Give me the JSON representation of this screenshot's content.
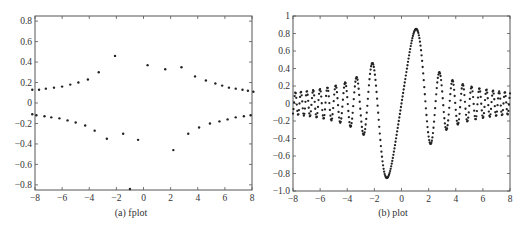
{
  "chart_data": [
    {
      "type": "scatter",
      "title": "",
      "caption": "(a) fplot",
      "function": "sin(x^2)/x",
      "xlabel": "",
      "ylabel": "",
      "xlim": [
        -8,
        8
      ],
      "ylim": [
        -0.85,
        0.85
      ],
      "xticks": [
        -8,
        -6,
        -4,
        -2,
        0,
        2,
        4,
        6,
        8
      ],
      "yticks": [
        -0.8,
        -0.6,
        -0.4,
        -0.2,
        0,
        0.2,
        0.4,
        0.6,
        0.8
      ],
      "xtick_labels": [
        "−8",
        "−6",
        "−4",
        "−2",
        "0",
        "2",
        "4",
        "6",
        "8"
      ],
      "ytick_labels": [
        "−0.8",
        "−0.6",
        "−0.4",
        "−0.2",
        "0",
        "0.2",
        "0.4",
        "0.6",
        "0.8"
      ],
      "grid": false,
      "marker": "dot",
      "series": [
        {
          "name": "upper",
          "points": [
            [
              -8.2,
              0.13
            ],
            [
              -7.7,
              0.13
            ],
            [
              -7.2,
              0.14
            ],
            [
              -6.6,
              0.15
            ],
            [
              -6.0,
              0.16
            ],
            [
              -5.4,
              0.18
            ],
            [
              -4.8,
              0.2
            ],
            [
              -4.1,
              0.23
            ],
            [
              -3.3,
              0.3
            ],
            [
              -2.1,
              0.46
            ],
            [
              0.3,
              0.37
            ],
            [
              1.6,
              0.33
            ],
            [
              2.8,
              0.35
            ],
            [
              3.8,
              0.26
            ],
            [
              4.6,
              0.22
            ],
            [
              5.3,
              0.19
            ],
            [
              5.8,
              0.17
            ],
            [
              6.3,
              0.15
            ],
            [
              6.8,
              0.14
            ],
            [
              7.3,
              0.13
            ],
            [
              7.7,
              0.12
            ],
            [
              8.1,
              0.11
            ]
          ]
        },
        {
          "name": "lower",
          "points": [
            [
              -8.2,
              -0.11
            ],
            [
              -7.9,
              -0.12
            ],
            [
              -7.3,
              -0.13
            ],
            [
              -6.8,
              -0.14
            ],
            [
              -6.2,
              -0.15
            ],
            [
              -5.6,
              -0.17
            ],
            [
              -5.0,
              -0.19
            ],
            [
              -4.3,
              -0.22
            ],
            [
              -3.6,
              -0.27
            ],
            [
              -2.7,
              -0.35
            ],
            [
              -1.5,
              -0.3
            ],
            [
              -1.0,
              -0.84
            ],
            [
              -0.4,
              -0.36
            ],
            [
              2.2,
              -0.46
            ],
            [
              3.3,
              -0.3
            ],
            [
              4.1,
              -0.24
            ],
            [
              4.9,
              -0.2
            ],
            [
              5.6,
              -0.18
            ],
            [
              6.2,
              -0.16
            ],
            [
              6.8,
              -0.14
            ],
            [
              7.4,
              -0.13
            ],
            [
              7.9,
              -0.12
            ]
          ]
        }
      ]
    },
    {
      "type": "scatter",
      "title": "",
      "caption": "(b) plot",
      "function": "sin(x^2)/x",
      "xlabel": "",
      "ylabel": "",
      "xlim": [
        -8,
        8
      ],
      "ylim": [
        -1.0,
        1.0
      ],
      "xticks": [
        -8,
        -6,
        -4,
        -2,
        0,
        2,
        4,
        6,
        8
      ],
      "yticks": [
        -1.0,
        -0.8,
        -0.6,
        -0.4,
        -0.2,
        0,
        0.2,
        0.4,
        0.6,
        0.8,
        1
      ],
      "xtick_labels": [
        "−8",
        "−6",
        "−4",
        "−2",
        "0",
        "2",
        "4",
        "6",
        "8"
      ],
      "ytick_labels": [
        "−1.0",
        "−0.8",
        "−0.6",
        "−0.4",
        "−0.2",
        "0",
        "0.2",
        "0.4",
        "0.6",
        "0.8",
        "1"
      ],
      "grid": false,
      "marker": "dot",
      "sampling": {
        "x_start": -8,
        "x_end": 8,
        "step": 0.04
      },
      "key_extrema": [
        [
          -3.2,
          0.29
        ],
        [
          -2.7,
          -0.35
        ],
        [
          -2.1,
          0.46
        ],
        [
          -1.0,
          -0.84
        ],
        [
          1.1,
          0.85
        ],
        [
          2.2,
          -0.45
        ],
        [
          2.8,
          0.35
        ],
        [
          3.35,
          -0.29
        ]
      ]
    }
  ]
}
